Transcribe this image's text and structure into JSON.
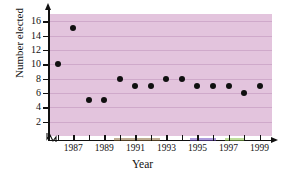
{
  "chart_data": {
    "type": "scatter",
    "title": "",
    "xlabel": "Year",
    "ylabel": "Number elected",
    "xlim": [
      1985.5,
      1999.8
    ],
    "ylim": [
      0,
      17
    ],
    "grid": true,
    "legend": null,
    "x": [
      1986,
      1987,
      1988,
      1989,
      1990,
      1991,
      1992,
      1993,
      1994,
      1995,
      1996,
      1997,
      1998,
      1999
    ],
    "values": [
      10,
      15,
      5,
      5,
      8,
      7,
      7,
      8,
      8,
      7,
      7,
      7,
      6,
      7
    ],
    "ytick_labels": [
      "2",
      "4",
      "6",
      "8",
      "10",
      "12",
      "14",
      "16"
    ],
    "ytick_values": [
      2,
      4,
      6,
      8,
      10,
      12,
      14,
      16
    ],
    "xtick_values": [
      1986,
      1987,
      1988,
      1989,
      1990,
      1991,
      1992,
      1993,
      1994,
      1995,
      1996,
      1997,
      1998,
      1999
    ],
    "xtick_labels": [
      "",
      "1987",
      "",
      "1989",
      "",
      "1991",
      "",
      "1993",
      "",
      "1995",
      "",
      "1997",
      "",
      "1999"
    ],
    "marker_color": "#101010",
    "plot_background": "#e3c4dd",
    "gridline_color": "#cfa9ca",
    "axis_color": "#111111",
    "axis_break": true
  }
}
